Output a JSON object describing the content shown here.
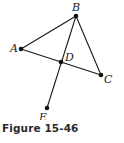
{
  "figure": {
    "caption": "Figure 15-46",
    "points": {
      "A": {
        "label": "A",
        "x": 21,
        "y": 49
      },
      "B": {
        "label": "B",
        "x": 76,
        "y": 16
      },
      "C": {
        "label": "C",
        "x": 101,
        "y": 75
      },
      "D": {
        "label": "D",
        "x": 61,
        "y": 62
      },
      "E": {
        "label": "E",
        "x": 47,
        "y": 108
      }
    },
    "segments": [
      [
        "A",
        "B"
      ],
      [
        "B",
        "C"
      ],
      [
        "A",
        "C"
      ],
      [
        "B",
        "E"
      ]
    ],
    "line_color": "#1a1a1a"
  }
}
